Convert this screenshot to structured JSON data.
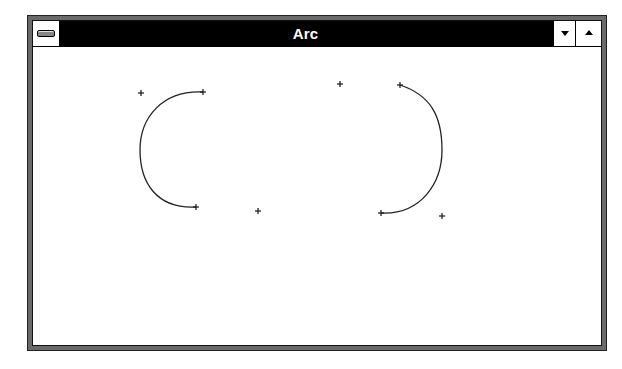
{
  "window": {
    "title": "Arc",
    "system_menu_icon": "system-menu-icon",
    "minimize_icon": "triangle-down-icon",
    "maximize_icon": "triangle-up-icon"
  },
  "client": {
    "background": "#ffffff",
    "stroke_color": "#222222",
    "drawings": [
      {
        "name": "arc-left",
        "bounding_corner_a": [
          141,
          93
        ],
        "bounding_corner_b": [
          258,
          211
        ],
        "arc_start": [
          203,
          92
        ],
        "arc_end": [
          196,
          207
        ],
        "leftmost_point": [
          140,
          150
        ],
        "direction": "counter-clockwise (opens right)"
      },
      {
        "name": "arc-right",
        "bounding_corner_a": [
          340,
          84
        ],
        "bounding_corner_b": [
          442,
          216
        ],
        "arc_start": [
          400,
          85
        ],
        "arc_end": [
          381,
          213
        ],
        "rightmost_point": [
          442,
          150
        ],
        "direction": "clockwise (opens left)"
      }
    ]
  }
}
